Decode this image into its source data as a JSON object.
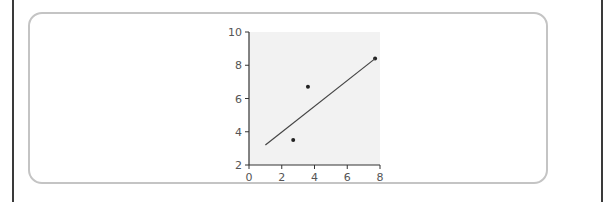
{
  "chart_data": {
    "type": "scatter",
    "title": "",
    "xlabel": "",
    "ylabel": "",
    "xlim": [
      0,
      8
    ],
    "ylim": [
      2,
      10
    ],
    "x_ticks": [
      "0",
      "2",
      "4",
      "6",
      "8"
    ],
    "y_ticks": [
      "2",
      "4",
      "6",
      "8",
      "10"
    ],
    "grid": false,
    "legend": null,
    "series": [
      {
        "name": "points",
        "type": "scatter",
        "x": [
          2.7,
          3.6,
          7.7
        ],
        "y": [
          3.5,
          6.7,
          8.4
        ]
      },
      {
        "name": "fit line",
        "type": "line",
        "x": [
          1.0,
          7.7
        ],
        "y": [
          3.2,
          8.4
        ]
      }
    ],
    "colors": {
      "plot_background": "#f2f2f2",
      "points": "#222222",
      "line": "#444444",
      "axes": "#333333"
    }
  }
}
